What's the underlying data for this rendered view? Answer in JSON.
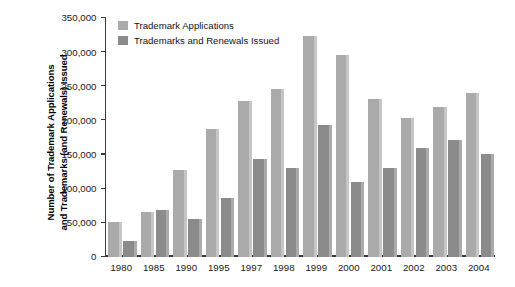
{
  "chart_data": {
    "type": "bar",
    "title": "",
    "subtitle": "",
    "xlabel": "",
    "ylabel": "Number of Trademark Applications and Trademarks (and Renewals) Issued",
    "ylabel_lines": [
      "Number of Trademark Applications",
      "and Trademarks (and Renewals) Issued"
    ],
    "categories": [
      "1980",
      "1985",
      "1990",
      "1995",
      "1997",
      "1998",
      "1999",
      "2000",
      "2001",
      "2002",
      "2003",
      "2004"
    ],
    "series": [
      {
        "name": "Trademark Applications",
        "color": "#aaaaaa",
        "values": [
          52000,
          66000,
          127000,
          188000,
          229000,
          246000,
          323000,
          296000,
          232000,
          203000,
          219000,
          240000
        ]
      },
      {
        "name": "Trademarks and Renewals Issued",
        "color": "#8b8b8b",
        "values": [
          23000,
          69000,
          56000,
          87000,
          144000,
          131000,
          193000,
          110000,
          131000,
          159000,
          172000,
          151000
        ]
      }
    ],
    "ylim": [
      0,
      350000
    ],
    "yticks": [
      0,
      50000,
      100000,
      150000,
      200000,
      250000,
      300000,
      350000
    ],
    "ytick_labels": [
      "0",
      "50,000",
      "100,000",
      "150,000",
      "200,000",
      "250,000",
      "300,000",
      "350,000"
    ],
    "grid": false,
    "legend_position": "top-left",
    "legend": [
      {
        "label": "Trademark Applications",
        "color": "#aaaaaa",
        "swatch_name": "legend-swatch-applications"
      },
      {
        "label": "Trademarks and Renewals Issued",
        "color": "#8b8b8b",
        "swatch_name": "legend-swatch-issued"
      }
    ]
  },
  "colors": {
    "background": "#ffffff",
    "axis": "#3b3b3b",
    "text": "#1a1a1a",
    "series_applications": "#aaaaaa",
    "series_applications_side": "#c6c6c6",
    "series_issued": "#8b8b8b",
    "series_issued_side": "#ababab"
  }
}
